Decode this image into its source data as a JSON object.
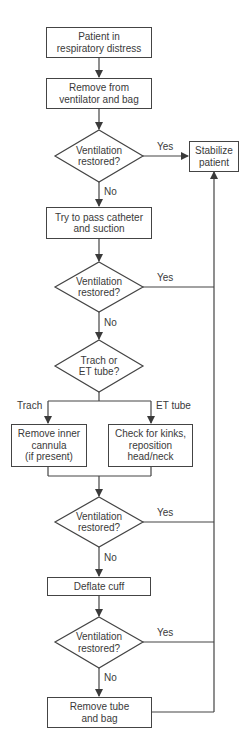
{
  "flowchart": {
    "nodes": {
      "start": "Patient in\nrespiratory distress",
      "remove_vent": "Remove from\nventilator and bag",
      "decision1": "Ventilation\nrestored?",
      "stabilize": "Stabilize\npatient",
      "catheter": "Try to pass catheter\nand suction",
      "decision2": "Ventilation\nrestored?",
      "decision3": "Trach or\nET tube?",
      "trach_action": "Remove inner\ncannula\n(if present)",
      "et_action": "Check for kinks,\nreposition\nhead/neck",
      "decision4": "Ventilation\nrestored?",
      "deflate": "Deflate cuff",
      "decision5": "Ventilation\nrestored?",
      "remove_tube": "Remove tube\nand bag"
    },
    "labels": {
      "yes": "Yes",
      "no": "No",
      "trach": "Trach",
      "et_tube": "ET tube"
    },
    "colors": {
      "line": "#444444",
      "text": "#3a3a3a",
      "background": "#ffffff"
    }
  }
}
